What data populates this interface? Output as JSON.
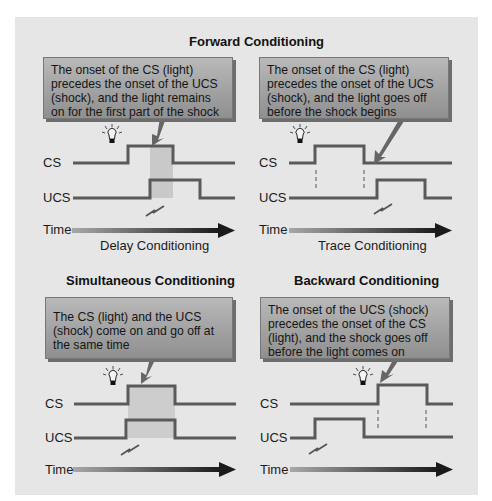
{
  "main_title": "Forward Conditioning",
  "panels": [
    {
      "id": "delay",
      "callout": "The onset of the CS (light) precedes the onset of the UCS (shock), and the light remains on for the first part of the shock",
      "caption": "Delay Conditioning",
      "labels": {
        "cs": "CS",
        "ucs": "UCS",
        "time": "Time"
      }
    },
    {
      "id": "trace",
      "callout": "The onset of the CS (light) precedes the onset of the UCS (shock), and the light goes off before the shock begins",
      "caption": "Trace Conditioning",
      "labels": {
        "cs": "CS",
        "ucs": "UCS",
        "time": "Time"
      }
    },
    {
      "id": "simultaneous",
      "title": "Simultaneous Conditioning",
      "callout": "The CS (light) and the UCS (shock) come on and go off at the same time",
      "labels": {
        "cs": "CS",
        "ucs": "UCS",
        "time": "Time"
      }
    },
    {
      "id": "backward",
      "title": "Backward Conditioning",
      "callout": "The onset of the UCS (shock) precedes the onset of the CS (light), and the shock goes off before the light comes on",
      "labels": {
        "cs": "CS",
        "ucs": "UCS",
        "time": "Time"
      }
    }
  ],
  "colors": {
    "background": "#e6e6e6",
    "signal_line": "#5a5a5a",
    "overlap_shade": "#c9c9c9",
    "callout_top": "#b9b9b9",
    "callout_bottom": "#8f8f8f"
  }
}
